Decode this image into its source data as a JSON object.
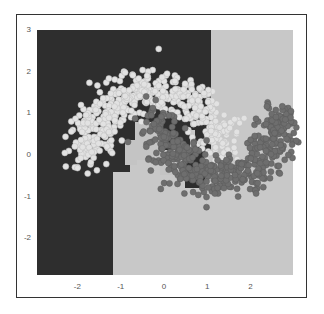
{
  "chart_data": {
    "type": "scatter",
    "title": "",
    "xlabel": "",
    "ylabel": "",
    "xlim": [
      -2.95,
      2.95
    ],
    "ylim": [
      -2.95,
      3.0
    ],
    "x_ticks": [
      "-2",
      "-1",
      "0",
      "1",
      "2"
    ],
    "y_ticks": [
      "3",
      "2",
      "1",
      "0",
      "-1",
      "-2"
    ],
    "grid": false,
    "legend": null,
    "background": "decision boundary (two classes: dark region / light region)",
    "decision_regions": [
      {
        "class": "upper moon",
        "color": "#2b2b2b",
        "rects": [
          [
            -2.95,
            3.0,
            1.05,
            -2.95
          ],
          [
            -2.95,
            3.0,
            -1.15,
            -2.95
          ],
          [
            -1.15,
            0.9,
            0.3,
            -0.45
          ],
          [
            0.3,
            0.9,
            0.95,
            -0.95
          ]
        ]
      },
      {
        "class": "lower moon",
        "color": "#c6c6c6",
        "rects": [
          [
            1.05,
            3.0,
            2.95,
            -2.95
          ],
          [
            -1.15,
            -0.45,
            2.95,
            -2.95
          ],
          [
            -0.75,
            0.65,
            0.3,
            -0.45
          ],
          [
            0.3,
            -0.2,
            0.65,
            -0.95
          ]
        ]
      }
    ],
    "series": [
      {
        "name": "class 0 (upper moon)",
        "color": "#e2e2e2",
        "center": [
          0,
          0
        ],
        "radius": 1.0,
        "angle_range": [
          0,
          180
        ],
        "noise": 0.25,
        "n": 500
      },
      {
        "name": "class 1 (lower moon)",
        "color": "#6e6e6e",
        "center": [
          1,
          0.5
        ],
        "radius": 1.0,
        "angle_range": [
          180,
          360
        ],
        "noise": 0.25,
        "n": 500
      }
    ]
  }
}
